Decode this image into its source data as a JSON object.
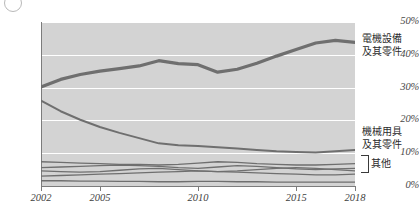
{
  "figure": {
    "corner_mark": "",
    "background_color": "#ffffff",
    "plot_background_color": "#d3d3d3",
    "line_color": "#6f6f6f",
    "gridline_color": "#ffffff",
    "axis_color": "#7c7c7c"
  },
  "labels": {
    "electrical": "電機設備",
    "electrical_2": "及其零件",
    "machinery": "機械用具",
    "machinery_2": "及其零件",
    "others": "其他"
  },
  "chart_data": {
    "type": "line",
    "title": "",
    "xlabel": "",
    "ylabel": "",
    "xlim": [
      2002,
      2018
    ],
    "ylim": [
      0,
      50
    ],
    "ytick_labels": [
      "0%",
      "10%",
      "20%",
      "30%",
      "40%",
      "50%"
    ],
    "ytick_values": [
      0,
      10,
      20,
      30,
      40,
      50
    ],
    "xtick_labels": [
      "2002",
      "2005",
      "2010",
      "2015",
      "2018"
    ],
    "xtick_values": [
      2002,
      2005,
      2010,
      2015,
      2018
    ],
    "grid": "horizontal",
    "legend_position": "right-outside",
    "x": [
      2002,
      2003,
      2004,
      2005,
      2006,
      2007,
      2008,
      2009,
      2010,
      2011,
      2012,
      2013,
      2014,
      2015,
      2016,
      2017,
      2018
    ],
    "series": [
      {
        "name": "電機設備及其零件",
        "label_text": "電機設備及其零件",
        "emphasis": "thick",
        "values": [
          30.2,
          32.5,
          34.0,
          35.0,
          35.8,
          36.6,
          38.2,
          37.3,
          37.0,
          34.7,
          35.6,
          37.4,
          39.6,
          41.6,
          43.6,
          44.4,
          43.8
        ]
      },
      {
        "name": "機械用具及其零件",
        "label_text": "機械用具及其零件",
        "emphasis": "medium",
        "values": [
          26.0,
          22.8,
          20.2,
          18.0,
          16.2,
          14.6,
          13.0,
          12.4,
          12.2,
          11.8,
          11.4,
          11.0,
          10.6,
          10.4,
          10.2,
          10.6,
          11.0
        ]
      },
      {
        "name": "其他-1",
        "label_text": "其他",
        "emphasis": "thin",
        "values": [
          7.4,
          7.2,
          7.0,
          6.8,
          6.6,
          6.6,
          6.4,
          6.6,
          7.0,
          7.4,
          7.2,
          6.8,
          6.6,
          6.4,
          6.4,
          6.6,
          6.8
        ]
      },
      {
        "name": "其他-2",
        "label_text": "其他",
        "emphasis": "thin",
        "values": [
          5.6,
          5.8,
          6.0,
          6.2,
          6.4,
          6.2,
          6.0,
          5.6,
          5.4,
          5.8,
          6.2,
          6.0,
          5.6,
          5.2,
          5.0,
          5.2,
          5.4
        ]
      },
      {
        "name": "其他-3",
        "label_text": "其他",
        "emphasis": "thin",
        "values": [
          4.6,
          4.4,
          4.2,
          4.4,
          4.8,
          5.2,
          5.4,
          5.0,
          4.6,
          4.4,
          4.6,
          5.0,
          5.4,
          5.6,
          5.4,
          5.0,
          4.6
        ]
      },
      {
        "name": "其他-4",
        "label_text": "其他",
        "emphasis": "thin",
        "values": [
          3.0,
          3.2,
          3.4,
          3.6,
          3.8,
          4.0,
          4.2,
          4.4,
          4.6,
          4.4,
          4.2,
          4.0,
          3.8,
          3.6,
          3.4,
          3.4,
          3.6
        ]
      },
      {
        "name": "其他-5",
        "label_text": "其他",
        "emphasis": "thin",
        "values": [
          1.6,
          1.6,
          1.5,
          1.5,
          1.4,
          1.4,
          1.3,
          1.3,
          1.4,
          1.4,
          1.3,
          1.3,
          1.2,
          1.2,
          1.2,
          1.2,
          1.2
        ]
      }
    ]
  }
}
